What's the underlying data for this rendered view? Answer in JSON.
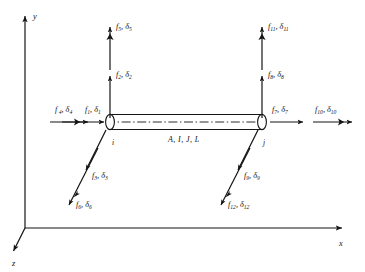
{
  "figure": {
    "background": "#ffffff",
    "ink": "#141414"
  },
  "axes": {
    "x_label": "x",
    "y_label": "y",
    "z_label": "z",
    "origin": [
      25,
      228
    ]
  },
  "element": {
    "property_label": "A, I, J, L",
    "node_i_label": "i",
    "node_j_label": "j"
  },
  "dofs": {
    "f4": {
      "force": "f",
      "force_sub": "4",
      "disp": "δ",
      "disp_sub": "4",
      "comma": ", "
    },
    "f1": {
      "force": "f",
      "force_sub": "1",
      "disp": "δ",
      "disp_sub": "1",
      "comma": ", "
    },
    "f2": {
      "force": "f",
      "force_sub": "2",
      "disp": "δ",
      "disp_sub": "2",
      "comma": ", "
    },
    "f5": {
      "force": "f",
      "force_sub": "5",
      "disp": "δ",
      "disp_sub": "5",
      "comma": ", "
    },
    "f3": {
      "force": "f",
      "force_sub": "3",
      "disp": "δ",
      "disp_sub": "3",
      "comma": ", "
    },
    "f6": {
      "force": "f",
      "force_sub": "6",
      "disp": "δ",
      "disp_sub": "6",
      "comma": ", "
    },
    "f7": {
      "force": "f",
      "force_sub": "7",
      "disp": "δ",
      "disp_sub": "7",
      "comma": ", "
    },
    "f10": {
      "force": "f",
      "force_sub": "10",
      "disp": "δ",
      "disp_sub": "10",
      "comma": ", "
    },
    "f8": {
      "force": "f",
      "force_sub": "8",
      "disp": "δ",
      "disp_sub": "8",
      "comma": ", "
    },
    "f11": {
      "force": "f",
      "force_sub": "11",
      "disp": "δ",
      "disp_sub": "11",
      "comma": ", "
    },
    "f9": {
      "force": "f",
      "force_sub": "9",
      "disp": "δ",
      "disp_sub": "9",
      "comma": ", "
    },
    "f12": {
      "force": "f",
      "force_sub": "12",
      "disp": "δ",
      "disp_sub": "12",
      "comma": ", "
    }
  }
}
